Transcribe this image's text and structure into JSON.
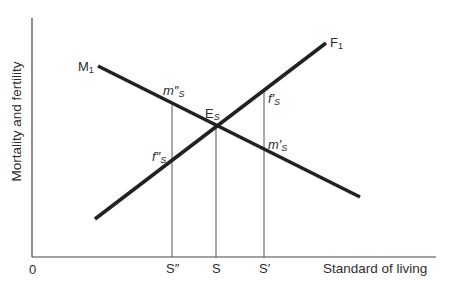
{
  "diagram": {
    "y_axis_label": "Mortality and fertility",
    "x_axis_label": "Standard of living",
    "origin_label": "0",
    "curves": [
      {
        "name": "M",
        "subscript": "1",
        "description": "mortality curve, downward sloping",
        "from": [
          98,
          66
        ],
        "to": [
          360,
          197
        ]
      },
      {
        "name": "F",
        "subscript": "1",
        "description": "fertility curve, upward sloping",
        "from": [
          95,
          219
        ],
        "to": [
          326,
          43
        ]
      }
    ],
    "equilibrium": {
      "label": "E",
      "sub": "S"
    },
    "point_labels": {
      "m_double_prime": {
        "base": "m",
        "mark": "″",
        "sub": "S"
      },
      "f_prime": {
        "base": "f",
        "mark": "′",
        "sub": "S"
      },
      "f_double_prime": {
        "base": "f",
        "mark": "″",
        "sub": "S"
      },
      "m_prime": {
        "base": "m",
        "mark": "′",
        "sub": "S"
      }
    },
    "x_ticks": [
      {
        "label": "S″",
        "x": 172
      },
      {
        "label": "S",
        "x": 216
      },
      {
        "label": "S′",
        "x": 264
      }
    ]
  }
}
